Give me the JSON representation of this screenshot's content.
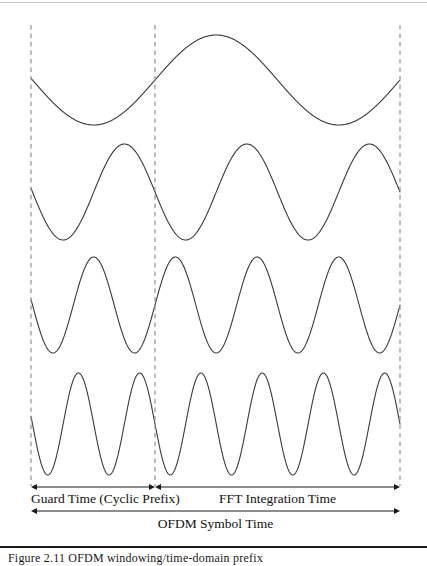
{
  "figure": {
    "background_color": "#ffffff",
    "line_color": "#3a3a3a",
    "dash_color": "#9a9a9a",
    "rule_top_color": "#c9c9c9",
    "rule_bottom_color": "#1d1d1d"
  },
  "labels": {
    "guard_time": "Guard Time (Cyclic Prefix)",
    "fft_time": "FFT Integration Time",
    "ofdm_symbol_time": "OFDM Symbol Time"
  },
  "caption": {
    "text": "Figure 2.11   OFDM windowing/time-domain prefix"
  },
  "chart_data": {
    "type": "line",
    "xlabel": "OFDM Symbol Time",
    "ylabel": "",
    "grid": false,
    "legend": "none",
    "xlim": [
      31,
      400
    ],
    "annotations": [
      {
        "name": "guard-time",
        "label": "Guard Time (Cyclic Prefix)",
        "x_start": 31,
        "x_end": 155
      },
      {
        "name": "fft-integration-time",
        "label": "FFT Integration Time",
        "x_start": 155,
        "x_end": 400
      },
      {
        "name": "ofdm-symbol-time",
        "label": "OFDM Symbol Time",
        "x_start": 31,
        "x_end": 400
      }
    ],
    "markers": {
      "guard_start_x": 31,
      "fft_start_x": 155,
      "symbol_end_x": 400,
      "dash_top_y": 25,
      "dash_bottom_y": 486
    },
    "series": [
      {
        "name": "subcarrier-1",
        "cycles_in_fft": 1,
        "center_y": 80,
        "amplitude": 45,
        "x_start": 31,
        "x_end": 400,
        "fft_start_x": 155,
        "phase_deg": 0
      },
      {
        "name": "subcarrier-2",
        "cycles_in_fft": 2,
        "center_y": 192,
        "amplitude": 48,
        "x_start": 31,
        "x_end": 400,
        "fft_start_x": 155,
        "phase_deg": 180
      },
      {
        "name": "subcarrier-3",
        "cycles_in_fft": 3,
        "center_y": 305,
        "amplitude": 48,
        "x_start": 31,
        "x_end": 400,
        "fft_start_x": 155,
        "phase_deg": 0
      },
      {
        "name": "subcarrier-4",
        "cycles_in_fft": 4,
        "center_y": 424,
        "amplitude": 51,
        "x_start": 31,
        "x_end": 400,
        "fft_start_x": 155,
        "phase_deg": 180
      }
    ]
  }
}
